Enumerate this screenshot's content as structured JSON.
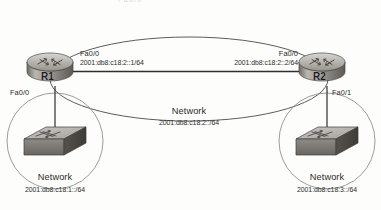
{
  "diagram": {
    "title_clipped": "Fa0/0",
    "background_color": "#fdfdfc",
    "line_color": "#3a3a3a",
    "device_color": "#8d8d8d"
  },
  "routers": [
    {
      "id": "r1",
      "label": "R1",
      "interface": "Fa0/0",
      "address": "2001:db8:c18:2::1/64",
      "lan_interface": "Fa0/0"
    },
    {
      "id": "r2",
      "label": "R2",
      "interface": "Fa0/0",
      "address": "2001:db8:c18:2::2/64",
      "lan_interface": "Fa0/1"
    }
  ],
  "networks": [
    {
      "id": "net-left",
      "label": "Network",
      "address": "2001:db8:c18:1::/64"
    },
    {
      "id": "net-center",
      "label": "Network",
      "address": "2001:db8:c18:2::/64"
    },
    {
      "id": "net-right",
      "label": "Network",
      "address": "2001:db8:c18:3::/64"
    }
  ]
}
